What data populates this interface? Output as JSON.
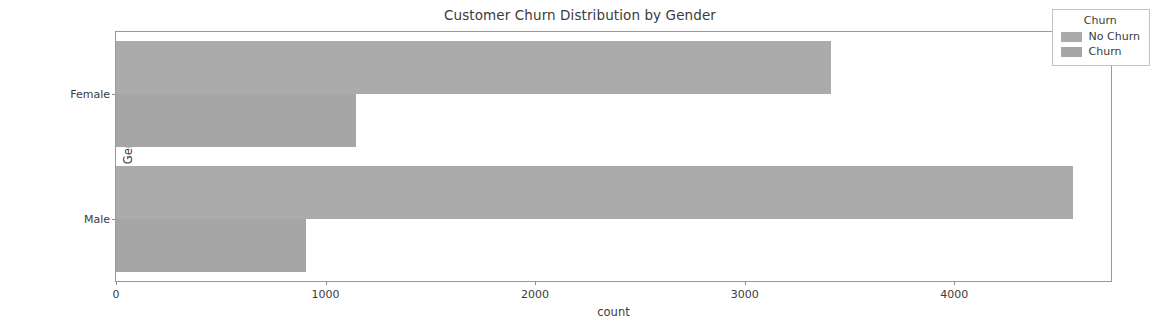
{
  "chart_data": {
    "type": "bar",
    "orientation": "horizontal",
    "title": "Customer Churn Distribution by Gender",
    "xlabel": "count",
    "ylabel": "Gender",
    "categories": [
      "Female",
      "Male"
    ],
    "series": [
      {
        "name": "No Churn",
        "values": [
          3414,
          4566
        ],
        "color": "#ababab"
      },
      {
        "name": "Churn",
        "values": [
          1143,
          905
        ],
        "color": "#a6a6a6"
      }
    ],
    "xlim": [
      0,
      4748
    ],
    "xticks": [
      0,
      1000,
      2000,
      3000,
      4000
    ],
    "xtick_labels": [
      "0",
      "1000",
      "2000",
      "3000",
      "4000"
    ],
    "grid": false,
    "legend": {
      "title": "Churn",
      "position": "upper right",
      "entries": [
        "No Churn",
        "Churn"
      ]
    }
  }
}
